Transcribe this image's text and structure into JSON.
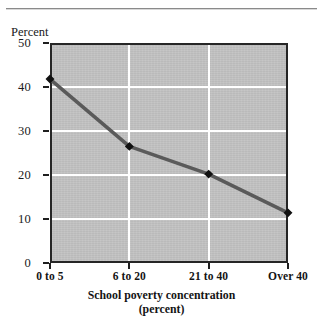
{
  "figure": {
    "top_rule": "horizontal-rule",
    "ylabel": "Percent",
    "xtitle_line1": "School poverty concentration",
    "xtitle_line2": "(percent)"
  },
  "chart_data": {
    "type": "line",
    "title": "",
    "xlabel": "School poverty concentration (percent)",
    "ylabel": "Percent",
    "categories": [
      "0 to 5",
      "6 to 20",
      "21 to 40",
      "Over 40"
    ],
    "values": [
      41.8,
      26.5,
      20.2,
      11.4
    ],
    "ylim": [
      0,
      50
    ],
    "yticks": [
      "0",
      "10",
      "20",
      "30",
      "40",
      "50"
    ],
    "ytick_values": [
      0,
      10,
      20,
      30,
      40,
      50
    ],
    "grid": "white gridlines on gray panel",
    "legend": "none",
    "series_color": "#5a5a5a",
    "marker_color": "#111111",
    "panel_color": "#c2c2c2",
    "gridline_color": "#ffffff",
    "axis_color": "#262626"
  }
}
